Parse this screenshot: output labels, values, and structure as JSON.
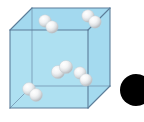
{
  "figure": {
    "title": "Gas molecules in a cubic container",
    "caption": "",
    "canvas": {
      "width": 144,
      "height": 122,
      "background": "#ffffff"
    }
  },
  "palette": {
    "face_fill": "#a9dcef",
    "face_fill_top": "#9ed7ee",
    "face_fill_front": "#aadef0",
    "face_fill_side": "#9fd8ee",
    "edge_stroke": "#5c7d99",
    "edge_stroke_light": "#7fa3bd",
    "sphere_light": "#ffffff",
    "sphere_mid": "#e4e6e8",
    "sphere_shadow": "#b9bdc1",
    "sphere_outline": "#c6cbcf",
    "dot_fill": "#000000",
    "background": "#ffffff"
  },
  "container": {
    "shape": "cube",
    "label": "container",
    "projection": "oblique",
    "depth_offset_x": 22,
    "depth_offset_y": -22,
    "front_face": {
      "x": 10,
      "y": 30,
      "width": 78,
      "height": 78
    },
    "opacity": 0.95,
    "edge_width": 1.1
  },
  "molecules": [
    {
      "id": "molecule-1",
      "label": "gas molecule",
      "atoms": [
        {
          "cx": 45,
          "cy": 21,
          "r": 6.2
        },
        {
          "cx": 52,
          "cy": 27,
          "r": 6.2
        }
      ]
    },
    {
      "id": "molecule-2",
      "label": "gas molecule",
      "atoms": [
        {
          "cx": 88,
          "cy": 16,
          "r": 6.2
        },
        {
          "cx": 95,
          "cy": 22,
          "r": 6.2
        }
      ]
    },
    {
      "id": "molecule-3",
      "label": "gas molecule",
      "atoms": [
        {
          "cx": 58,
          "cy": 72,
          "r": 6.6
        },
        {
          "cx": 66,
          "cy": 67,
          "r": 6.6
        }
      ]
    },
    {
      "id": "molecule-4",
      "label": "gas molecule",
      "atoms": [
        {
          "cx": 29,
          "cy": 89,
          "r": 6.4
        },
        {
          "cx": 36,
          "cy": 95,
          "r": 6.4
        }
      ]
    },
    {
      "id": "molecule-5",
      "label": "gas molecule",
      "atoms": [
        {
          "cx": 80,
          "cy": 73,
          "r": 6.2
        },
        {
          "cx": 86,
          "cy": 80,
          "r": 6.2
        }
      ]
    }
  ],
  "dot_marker": {
    "id": "dot-marker",
    "label": "filled black circle",
    "cx": 136,
    "cy": 90,
    "r": 16,
    "color": "#000000"
  }
}
